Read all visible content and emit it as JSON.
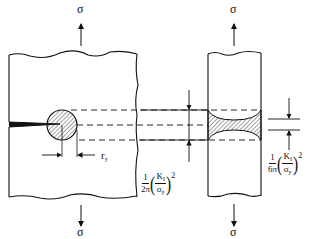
{
  "diagram": {
    "type": "fracture-mechanics-plastic-zone",
    "left_panel": {
      "stress_top_label": "σ",
      "stress_bottom_label": "σ",
      "plastic_zone_radius_label": "r",
      "plastic_zone_radius_subscript": "y"
    },
    "right_panel": {
      "stress_top_label": "σ",
      "stress_bottom_label": "σ"
    },
    "formula_plane_stress": {
      "coef_num": "1",
      "coef_den": "2π",
      "ratio_num": "K",
      "ratio_num_sub": "I",
      "ratio_den": "σ",
      "ratio_den_sub": "y",
      "exponent": "2"
    },
    "formula_plane_strain": {
      "coef_num": "1",
      "coef_den": "6π",
      "ratio_num": "K",
      "ratio_num_sub": "I",
      "ratio_den": "σ",
      "ratio_den_sub": "y",
      "exponent": "2"
    },
    "colors": {
      "line": "#111111",
      "background": "#ffffff"
    }
  }
}
